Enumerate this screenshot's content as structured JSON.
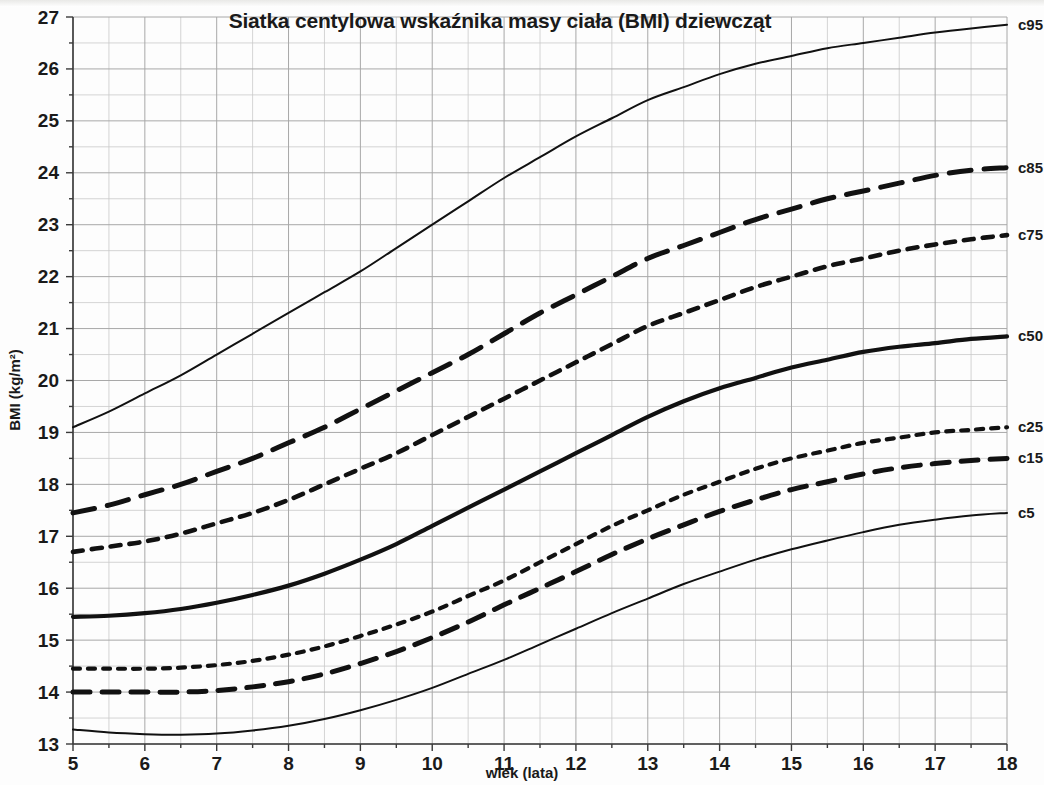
{
  "chart_data": {
    "type": "line",
    "title": "Siatka centylowa wskaźnika masy ciała (BMI) dziewcząt",
    "xlabel": "wiek (lata)",
    "ylabel": "BMI (kg/m²)",
    "xlim": [
      5,
      18
    ],
    "ylim": [
      13,
      27
    ],
    "xticks": [
      5,
      6,
      7,
      8,
      9,
      10,
      11,
      12,
      13,
      14,
      15,
      16,
      17,
      18
    ],
    "yticks": [
      13,
      14,
      15,
      16,
      17,
      18,
      19,
      20,
      21,
      22,
      23,
      24,
      25,
      26,
      27
    ],
    "grid": true,
    "grid_step_x": 0.5,
    "grid_step_y": 0.5,
    "legend_position": "right-of-line-ends",
    "x": [
      5,
      5.5,
      6,
      6.5,
      7,
      7.5,
      8,
      8.5,
      9,
      9.5,
      10,
      10.5,
      11,
      11.5,
      12,
      12.5,
      13,
      13.5,
      14,
      14.5,
      15,
      15.5,
      16,
      16.5,
      17,
      17.5,
      18
    ],
    "series": [
      {
        "name": "c95",
        "label": "c95",
        "style": "solid-thin",
        "color": "#111111",
        "values": [
          19.1,
          19.4,
          19.75,
          20.1,
          20.5,
          20.9,
          21.3,
          21.7,
          22.1,
          22.55,
          23.0,
          23.45,
          23.9,
          24.3,
          24.7,
          25.05,
          25.4,
          25.65,
          25.9,
          26.1,
          26.25,
          26.4,
          26.5,
          26.6,
          26.7,
          26.78,
          26.85
        ]
      },
      {
        "name": "c85",
        "label": "c85",
        "style": "dashed-long",
        "color": "#111111",
        "values": [
          17.45,
          17.6,
          17.8,
          18.0,
          18.25,
          18.5,
          18.8,
          19.1,
          19.45,
          19.8,
          20.15,
          20.5,
          20.9,
          21.3,
          21.65,
          22.0,
          22.35,
          22.6,
          22.85,
          23.1,
          23.3,
          23.5,
          23.65,
          23.8,
          23.95,
          24.05,
          24.1
        ]
      },
      {
        "name": "c75",
        "label": "c75",
        "style": "dotted-med",
        "color": "#111111",
        "values": [
          16.7,
          16.8,
          16.9,
          17.05,
          17.25,
          17.45,
          17.7,
          18.0,
          18.3,
          18.6,
          18.95,
          19.3,
          19.65,
          20.0,
          20.35,
          20.7,
          21.05,
          21.3,
          21.55,
          21.8,
          22.0,
          22.2,
          22.35,
          22.5,
          22.62,
          22.72,
          22.8
        ]
      },
      {
        "name": "c50",
        "label": "c50",
        "style": "solid-thick",
        "color": "#111111",
        "values": [
          15.45,
          15.47,
          15.52,
          15.6,
          15.72,
          15.87,
          16.05,
          16.28,
          16.55,
          16.85,
          17.2,
          17.55,
          17.9,
          18.25,
          18.6,
          18.95,
          19.3,
          19.6,
          19.85,
          20.05,
          20.25,
          20.4,
          20.55,
          20.65,
          20.72,
          20.8,
          20.85
        ]
      },
      {
        "name": "c25",
        "label": "c25",
        "style": "dotted-fine",
        "color": "#111111",
        "values": [
          14.45,
          14.45,
          14.45,
          14.47,
          14.52,
          14.6,
          14.72,
          14.88,
          15.08,
          15.3,
          15.55,
          15.85,
          16.15,
          16.5,
          16.85,
          17.2,
          17.5,
          17.8,
          18.05,
          18.3,
          18.5,
          18.65,
          18.8,
          18.9,
          19.0,
          19.05,
          19.1
        ]
      },
      {
        "name": "c15",
        "label": "c15",
        "style": "dashed-med",
        "color": "#111111",
        "values": [
          14.0,
          14.0,
          14.0,
          14.0,
          14.03,
          14.1,
          14.2,
          14.35,
          14.55,
          14.78,
          15.05,
          15.35,
          15.68,
          16.0,
          16.32,
          16.65,
          16.95,
          17.22,
          17.48,
          17.7,
          17.9,
          18.05,
          18.2,
          18.32,
          18.4,
          18.46,
          18.5
        ]
      },
      {
        "name": "c5",
        "label": "c5",
        "style": "solid-thin",
        "color": "#111111",
        "values": [
          13.28,
          13.22,
          13.19,
          13.18,
          13.2,
          13.26,
          13.35,
          13.48,
          13.65,
          13.85,
          14.08,
          14.35,
          14.62,
          14.92,
          15.22,
          15.52,
          15.8,
          16.08,
          16.32,
          16.55,
          16.75,
          16.92,
          17.08,
          17.22,
          17.32,
          17.4,
          17.45
        ]
      }
    ]
  },
  "layout": {
    "plot_left": 73,
    "plot_right": 1007,
    "plot_top": 17,
    "plot_bottom": 744,
    "title_x": 500,
    "title_y": 28
  }
}
